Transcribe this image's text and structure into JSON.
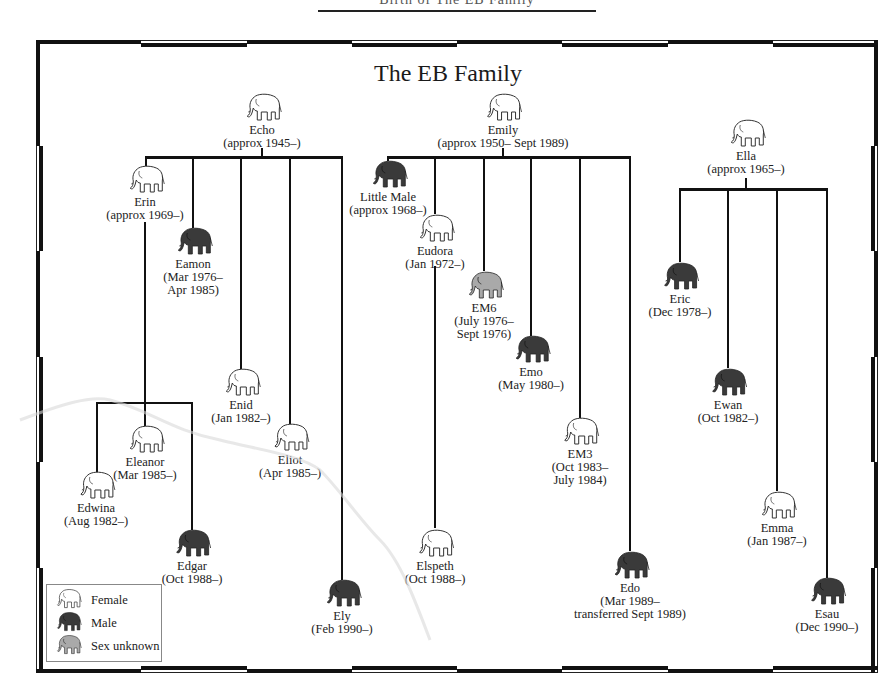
{
  "header": {
    "text": "Birth of The EB Family"
  },
  "title": "The EB Family",
  "colors": {
    "female_fill": "#ffffff",
    "male_fill": "#3a3a3a",
    "unknown_fill": "#a9a9a9",
    "line": "#111111"
  },
  "families": [
    {
      "mother": {
        "name": "Echo",
        "dates": "(approx 1945–)",
        "sex": "female"
      },
      "children": [
        {
          "name": "Erin",
          "dates": "(approx 1969–)",
          "sex": "female",
          "children": [
            {
              "name": "Edwina",
              "dates": "(Aug 1982–)",
              "sex": "female"
            },
            {
              "name": "Eleanor",
              "dates": "(Mar 1985–)",
              "sex": "female"
            },
            {
              "name": "Edgar",
              "dates": "(Oct 1988–)",
              "sex": "male"
            }
          ]
        },
        {
          "name": "Eamon",
          "dates": "(Mar 1976–",
          "dates2": "Apr 1985)",
          "sex": "male"
        },
        {
          "name": "Enid",
          "dates": "(Jan 1982–)",
          "sex": "female"
        },
        {
          "name": "Eliot",
          "dates": "(Apr 1985–)",
          "sex": "female"
        },
        {
          "name": "Ely",
          "dates": "(Feb 1990–)",
          "sex": "male"
        }
      ]
    },
    {
      "mother": {
        "name": "Emily",
        "dates": "(approx 1950– Sept 1989)",
        "sex": "female"
      },
      "children": [
        {
          "name": "Little Male",
          "dates": "(approx 1968–)",
          "sex": "male"
        },
        {
          "name": "Eudora",
          "dates": "(Jan 1972–)",
          "sex": "female",
          "children": [
            {
              "name": "Elspeth",
              "dates": "(Oct 1988–)",
              "sex": "female"
            }
          ]
        },
        {
          "name": "EM6",
          "dates": "(July 1976–",
          "dates2": "Sept 1976)",
          "sex": "unknown"
        },
        {
          "name": "Emo",
          "dates": "(May 1980–)",
          "sex": "male"
        },
        {
          "name": "EM3",
          "dates": "(Oct 1983–",
          "dates2": "July 1984)",
          "sex": "female"
        },
        {
          "name": "Edo",
          "dates": "(Mar 1989–",
          "dates2": "transferred Sept 1989)",
          "sex": "male"
        }
      ]
    },
    {
      "mother": {
        "name": "Ella",
        "dates": "(approx 1965–)",
        "sex": "female"
      },
      "children": [
        {
          "name": "Eric",
          "dates": "(Dec 1978–)",
          "sex": "male"
        },
        {
          "name": "Ewan",
          "dates": "(Oct 1982–)",
          "sex": "male"
        },
        {
          "name": "Emma",
          "dates": "(Jan 1987–)",
          "sex": "female"
        },
        {
          "name": "Esau",
          "dates": "(Dec 1990–)",
          "sex": "male"
        }
      ]
    }
  ],
  "legend": {
    "items": [
      {
        "label": "Female",
        "icon": "elephant-outline-icon"
      },
      {
        "label": "Male",
        "icon": "elephant-black-icon"
      },
      {
        "label": "Sex unknown",
        "icon": "elephant-gray-icon"
      }
    ]
  }
}
